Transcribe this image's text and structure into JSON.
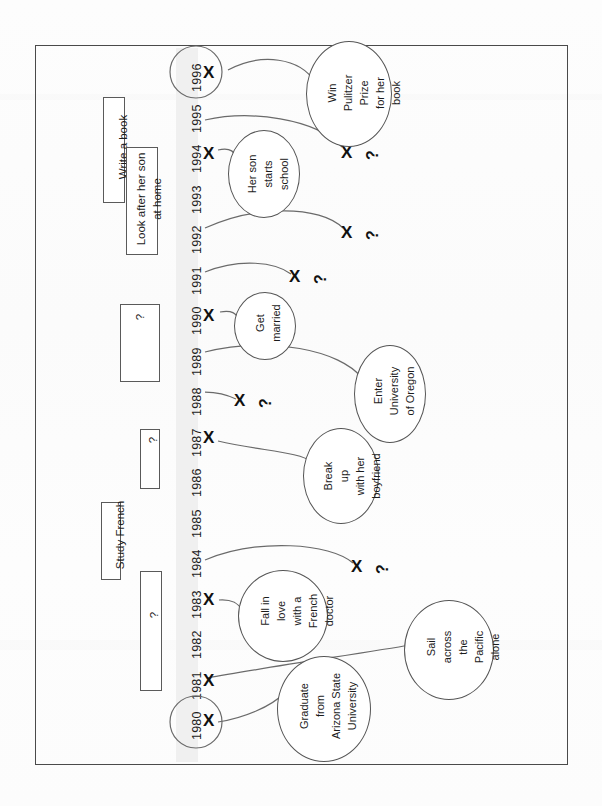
{
  "document": {
    "title": "Life timeline worksheet",
    "orientation": "rotated-90-ccw",
    "description": "Hand-drawn style life timeline from 1980 to 1996 with event bubbles, X markers and period boxes"
  },
  "colors": {
    "frame": "#4a4a4a",
    "axis_band": "#f0f0f0",
    "ink": "#1c1c1c",
    "line": "#555555",
    "paper": "#ffffff"
  },
  "timeline": {
    "name": "years-axis",
    "start": 1980,
    "end": 1996,
    "years": [
      "1996",
      "1995",
      "1994",
      "1993",
      "1992",
      "1991",
      "1990",
      "1989",
      "1988",
      "1987",
      "1986",
      "1985",
      "1984",
      "1983",
      "1982",
      "1981",
      "1980"
    ],
    "circled_years": [
      "1996",
      "1980"
    ]
  },
  "markers": [
    {
      "id": "mark-1996",
      "year": "1996",
      "symbol": "X",
      "has_question": false
    },
    {
      "id": "mark-1994",
      "year": "1994",
      "symbol": "X",
      "has_question": false
    },
    {
      "id": "mark-1990",
      "year": "1990",
      "symbol": "X",
      "has_question": false
    },
    {
      "id": "mark-1987",
      "year": "1987",
      "symbol": "X",
      "has_question": false
    },
    {
      "id": "mark-1983",
      "year": "1983",
      "symbol": "X",
      "has_question": false
    },
    {
      "id": "mark-1981",
      "year": "1981",
      "symbol": "X",
      "has_question": false
    },
    {
      "id": "mark-1980",
      "year": "1980",
      "symbol": "X",
      "has_question": false
    }
  ],
  "unknown_markers": [
    {
      "id": "unknown-1",
      "symbol": "X",
      "question": "?"
    },
    {
      "id": "unknown-2",
      "symbol": "X",
      "question": "?"
    },
    {
      "id": "unknown-3",
      "symbol": "X",
      "question": "?"
    },
    {
      "id": "unknown-4",
      "symbol": "X",
      "question": "?"
    },
    {
      "id": "unknown-5",
      "symbol": "X",
      "question": "?"
    }
  ],
  "events": [
    {
      "id": "event-pulitzer",
      "label": "Win\nPulitzer\nPrize\nfor her\nbook",
      "year": "1996",
      "shape": "ellipse"
    },
    {
      "id": "event-son-school",
      "label": "Her son\nstarts\nschool",
      "year": "1994",
      "shape": "ellipse"
    },
    {
      "id": "event-married",
      "label": "Get\nmarried",
      "year": "1990",
      "shape": "circle"
    },
    {
      "id": "event-university",
      "label": "Enter\nUniversity\nof Oregon",
      "year": "1989",
      "shape": "ellipse"
    },
    {
      "id": "event-breakup",
      "label": "Break\nup\nwith her\nboyfriend",
      "year": "1987",
      "shape": "ellipse"
    },
    {
      "id": "event-fall-in-love",
      "label": "Fall in\nlove\nwith a\nFrench\ndoctor",
      "year": "1983",
      "shape": "ellipse"
    },
    {
      "id": "event-sail",
      "label": "Sail\nacross\nthe\nPacific\nalone",
      "year": "1982",
      "shape": "circle"
    },
    {
      "id": "event-graduate",
      "label": "Graduate\nfrom\nArizona State\nUniversity",
      "year": "1981",
      "shape": "circle"
    }
  ],
  "period_boxes": [
    {
      "id": "period-write-book",
      "label": "Write a book",
      "known": true
    },
    {
      "id": "period-look-after-son",
      "label": "Look after her son\nat home",
      "known": true
    },
    {
      "id": "period-unknown-a",
      "label": "?",
      "known": false
    },
    {
      "id": "period-unknown-b",
      "label": "?",
      "known": false
    },
    {
      "id": "period-study-french",
      "label": "Study French",
      "known": true
    },
    {
      "id": "period-unknown-c",
      "label": "?",
      "known": false
    }
  ]
}
